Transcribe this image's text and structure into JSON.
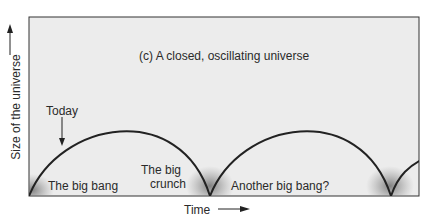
{
  "diagram": {
    "title": "(c) A closed, oscillating universe",
    "x_axis_label": "Time",
    "y_axis_label": "Size of the universe",
    "annotations": {
      "today": "Today",
      "big_bang": "The big bang",
      "big_crunch_line1": "The big",
      "big_crunch_line2": "crunch",
      "another_big_bang": "Another big bang?"
    },
    "colors": {
      "panel_background": "#ececec",
      "curve": "#222222",
      "glow": "#777777"
    }
  }
}
